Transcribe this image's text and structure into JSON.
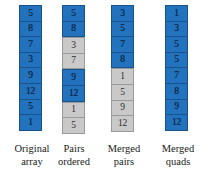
{
  "figure": {
    "colors": {
      "blue_fill": "#2272bd",
      "blue_border": "#17538e",
      "gray_fill": "#c9c9c9",
      "gray_border": "#9a9a9a",
      "text_dark": "#1a1a1a",
      "background": "#ffffff"
    },
    "columns": [
      {
        "label_line1": "Original",
        "label_line2": "array",
        "cells": [
          {
            "value": "5",
            "color": "blue"
          },
          {
            "value": "8",
            "color": "blue"
          },
          {
            "value": "7",
            "color": "blue"
          },
          {
            "value": "3",
            "color": "blue"
          },
          {
            "value": "9",
            "color": "blue"
          },
          {
            "value": "12",
            "color": "blue"
          },
          {
            "value": "5",
            "color": "blue"
          },
          {
            "value": "1",
            "color": "blue"
          }
        ]
      },
      {
        "label_line1": "Pairs",
        "label_line2": "ordered",
        "cells": [
          {
            "value": "5",
            "color": "blue"
          },
          {
            "value": "8",
            "color": "blue"
          },
          {
            "value": "3",
            "color": "gray"
          },
          {
            "value": "7",
            "color": "gray"
          },
          {
            "value": "9",
            "color": "blue"
          },
          {
            "value": "12",
            "color": "blue"
          },
          {
            "value": "1",
            "color": "gray"
          },
          {
            "value": "5",
            "color": "gray"
          }
        ]
      },
      {
        "label_line1": "Merged",
        "label_line2": "pairs",
        "cells": [
          {
            "value": "3",
            "color": "blue"
          },
          {
            "value": "5",
            "color": "blue"
          },
          {
            "value": "7",
            "color": "blue"
          },
          {
            "value": "8",
            "color": "blue"
          },
          {
            "value": "1",
            "color": "gray"
          },
          {
            "value": "5",
            "color": "gray"
          },
          {
            "value": "9",
            "color": "gray"
          },
          {
            "value": "12",
            "color": "gray"
          }
        ]
      },
      {
        "label_line1": "Merged",
        "label_line2": "quads",
        "cells": [
          {
            "value": "1",
            "color": "blue"
          },
          {
            "value": "3",
            "color": "blue"
          },
          {
            "value": "5",
            "color": "blue"
          },
          {
            "value": "5",
            "color": "blue"
          },
          {
            "value": "7",
            "color": "blue"
          },
          {
            "value": "8",
            "color": "blue"
          },
          {
            "value": "9",
            "color": "blue"
          },
          {
            "value": "12",
            "color": "blue"
          }
        ]
      }
    ]
  }
}
